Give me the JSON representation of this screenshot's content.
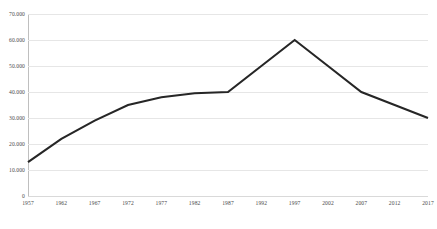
{
  "chart_data": {
    "type": "line",
    "title": "",
    "subtitle": "",
    "xlabel": "",
    "ylabel": "",
    "x": [
      1957,
      1962,
      1967,
      1972,
      1977,
      1982,
      1987,
      1992,
      1997,
      2002,
      2007,
      2012,
      2017
    ],
    "categories": [
      "1957",
      "1962",
      "1967",
      "1972",
      "1977",
      "1982",
      "1987",
      "1992",
      "1997",
      "2002",
      "2007",
      "2012",
      "2017"
    ],
    "values": [
      13000,
      22000,
      29000,
      35000,
      38000,
      39500,
      40000,
      50000,
      60000,
      50000,
      40000,
      35000,
      30000
    ],
    "series": [
      {
        "name": "",
        "values": [
          13000,
          22000,
          29000,
          35000,
          38000,
          39500,
          40000,
          50000,
          60000,
          50000,
          40000,
          35000,
          30000
        ]
      }
    ],
    "xlim": [
      1957,
      2017
    ],
    "ylim": [
      0,
      70000
    ],
    "ytick_values": [
      0,
      10000,
      20000,
      30000,
      40000,
      50000,
      60000,
      70000
    ],
    "ytick_labels": [
      "0",
      "10.000",
      "20.000",
      "30.000",
      "40.000",
      "50.000",
      "60.000",
      "70.000"
    ],
    "xtick_labels": [
      "1957",
      "1962",
      "1967",
      "1972",
      "1977",
      "1982",
      "1987",
      "1992",
      "1997",
      "2002",
      "2007",
      "2012",
      "2017"
    ],
    "grid": "horizontal",
    "legend": "none",
    "annotations": [],
    "colors": {
      "line": "#262626",
      "gridline": "#e6e6e6",
      "axis": "#bfbfbf",
      "tick_label": "#4a4a4a",
      "background": "#ffffff"
    },
    "line_width": 2.1
  }
}
